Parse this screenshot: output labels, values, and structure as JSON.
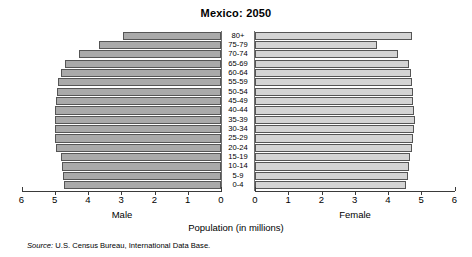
{
  "chart": {
    "title": "Mexico: 2050",
    "xlabel": "Population (in millions)",
    "male_label": "Male",
    "female_label": "Female",
    "source_prefix": "Source:",
    "source_text": "U.S. Census Bureau, International Data Base."
  },
  "chart_data": {
    "type": "bar",
    "subtype": "population-pyramid",
    "title": "Mexico: 2050",
    "xlabel": "Population (in millions)",
    "ylabel": "",
    "xlim": [
      0,
      6
    ],
    "xticks": [
      0,
      1,
      2,
      3,
      4,
      5,
      6
    ],
    "grid": false,
    "legend": [
      "Male",
      "Female"
    ],
    "legend_position": "below-axis",
    "categories": [
      "0-4",
      "5-9",
      "10-14",
      "15-19",
      "20-24",
      "25-29",
      "30-34",
      "35-39",
      "40-44",
      "45-49",
      "50-54",
      "55-59",
      "60-64",
      "65-69",
      "70-74",
      "75-79",
      "80+"
    ],
    "series": [
      {
        "name": "Male",
        "side": "left",
        "color": "#a9a9a9",
        "values": [
          4.72,
          4.75,
          4.78,
          4.8,
          4.95,
          4.98,
          5.0,
          5.0,
          4.98,
          4.95,
          4.92,
          4.9,
          4.82,
          4.7,
          4.28,
          3.68,
          2.95
        ]
      },
      {
        "name": "Female",
        "side": "right",
        "color": "#d4d4d4",
        "values": [
          4.55,
          4.6,
          4.62,
          4.65,
          4.72,
          4.75,
          4.78,
          4.8,
          4.78,
          4.76,
          4.74,
          4.72,
          4.68,
          4.62,
          4.3,
          3.68,
          4.72
        ]
      }
    ],
    "tick_labels_left": [
      "6",
      "5",
      "4",
      "3",
      "2",
      "1",
      "0"
    ],
    "tick_labels_right": [
      "0",
      "1",
      "2",
      "3",
      "4",
      "5",
      "6"
    ]
  }
}
